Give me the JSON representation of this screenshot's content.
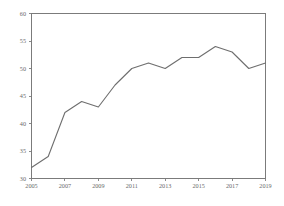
{
  "chart_data": {
    "type": "line",
    "title": "",
    "subtitle": "",
    "xlabel": "",
    "ylabel": "",
    "grid": false,
    "legend": false,
    "legend_position": "none",
    "line_color": "#6e6e6e",
    "axis_color": "#7b7b7b",
    "label_color": "#6a6a6a",
    "background_color": "#ffffff",
    "x": [
      2005,
      2006,
      2007,
      2008,
      2009,
      2010,
      2011,
      2012,
      2013,
      2014,
      2015,
      2016,
      2017,
      2018,
      2019
    ],
    "values": [
      32,
      34,
      42,
      44,
      43,
      47,
      50,
      51,
      50,
      52,
      52,
      54,
      53,
      50,
      51
    ],
    "series": [
      {
        "name": "series-1",
        "values": [
          32,
          34,
          42,
          44,
          43,
          47,
          50,
          51,
          50,
          52,
          52,
          54,
          53,
          50,
          51
        ]
      }
    ],
    "xlim": [
      2005,
      2019
    ],
    "ylim": [
      30,
      60
    ],
    "yticks": [
      30,
      35,
      40,
      45,
      50,
      55,
      60
    ],
    "ytick_labels": [
      "30",
      "35",
      "40",
      "45",
      "50",
      "55",
      "60"
    ],
    "xticks": [
      2005,
      2007,
      2009,
      2011,
      2013,
      2015,
      2017,
      2019
    ],
    "xtick_labels": [
      "2005",
      "2007",
      "2009",
      "2011",
      "2013",
      "2015",
      "2017",
      "2019"
    ]
  }
}
